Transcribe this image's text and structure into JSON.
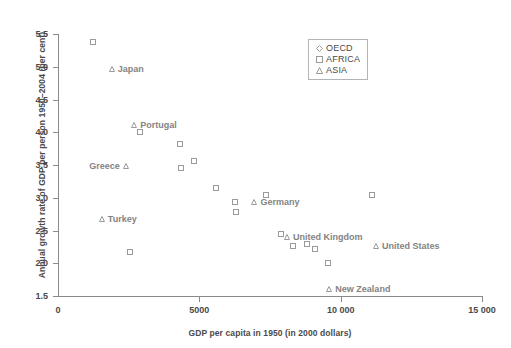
{
  "chart_data": {
    "type": "scatter",
    "title": "",
    "xlabel": "GDP per capita in 1950 (in 2000 dollars)",
    "ylabel": "Annual growth rate of GDP per person 1950–2004 (per cent)",
    "xlim": [
      0,
      15000
    ],
    "ylim": [
      1.5,
      5.5
    ],
    "grid": false,
    "legend_position": "top-right",
    "xticks": [
      {
        "value": 0,
        "label": "0"
      },
      {
        "value": 5000,
        "label": "5000"
      },
      {
        "value": 10000,
        "label": "10 000"
      },
      {
        "value": 15000,
        "label": "15 000"
      }
    ],
    "yticks": [
      {
        "value": 1.5,
        "label": "1.5"
      },
      {
        "value": 2.0,
        "label": "2.0"
      },
      {
        "value": 2.5,
        "label": "2.5"
      },
      {
        "value": 3.0,
        "label": "3.0"
      },
      {
        "value": 3.5,
        "label": "3.5"
      },
      {
        "value": 4.0,
        "label": "4.0"
      },
      {
        "value": 4.5,
        "label": "4.5"
      },
      {
        "value": 5.0,
        "label": "5.0"
      },
      {
        "value": 5.5,
        "label": "5.5"
      }
    ],
    "legend": [
      {
        "label": "OECD",
        "marker": "diamond"
      },
      {
        "label": "AFRICA",
        "marker": "square"
      },
      {
        "label": "ASIA",
        "marker": "triangle"
      }
    ],
    "series": [
      {
        "name": "OECD",
        "marker": "diamond",
        "points": []
      },
      {
        "name": "AFRICA",
        "marker": "square",
        "points": [
          {
            "x": 1250,
            "y": 5.38
          },
          {
            "x": 2900,
            "y": 4.0
          },
          {
            "x": 4300,
            "y": 3.82
          },
          {
            "x": 4350,
            "y": 3.46
          },
          {
            "x": 4800,
            "y": 3.56
          },
          {
            "x": 5600,
            "y": 3.15
          },
          {
            "x": 6250,
            "y": 2.93
          },
          {
            "x": 6300,
            "y": 2.78
          },
          {
            "x": 2550,
            "y": 2.17
          },
          {
            "x": 7350,
            "y": 3.04
          },
          {
            "x": 7900,
            "y": 2.45
          },
          {
            "x": 8300,
            "y": 2.27
          },
          {
            "x": 8800,
            "y": 2.3
          },
          {
            "x": 9100,
            "y": 2.21
          },
          {
            "x": 9550,
            "y": 2.0
          },
          {
            "x": 11100,
            "y": 3.04
          }
        ]
      },
      {
        "name": "ASIA",
        "marker": "triangle",
        "points": [
          {
            "x": 1900,
            "y": 4.97
          },
          {
            "x": 2700,
            "y": 4.11
          },
          {
            "x": 2400,
            "y": 3.48
          },
          {
            "x": 1550,
            "y": 2.67
          },
          {
            "x": 6950,
            "y": 2.93
          },
          {
            "x": 8100,
            "y": 2.4
          },
          {
            "x": 11250,
            "y": 2.26
          },
          {
            "x": 9600,
            "y": 1.6
          }
        ]
      }
    ],
    "annotations": [
      {
        "text": "Japan",
        "x": 1900,
        "y": 4.97,
        "align": "right"
      },
      {
        "text": "Portugal",
        "x": 2700,
        "y": 4.11,
        "align": "right"
      },
      {
        "text": "Greece",
        "x": 2400,
        "y": 3.48,
        "align": "left"
      },
      {
        "text": "Turkey",
        "x": 1550,
        "y": 2.67,
        "align": "right"
      },
      {
        "text": "Germany",
        "x": 6950,
        "y": 2.93,
        "align": "right"
      },
      {
        "text": "United Kingdom",
        "x": 8100,
        "y": 2.4,
        "align": "right"
      },
      {
        "text": "United States",
        "x": 11250,
        "y": 2.26,
        "align": "right"
      },
      {
        "text": "New Zealand",
        "x": 9600,
        "y": 1.6,
        "align": "right"
      }
    ]
  }
}
